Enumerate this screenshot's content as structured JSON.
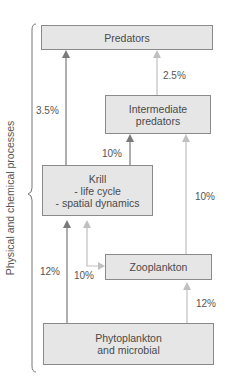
{
  "side_label": "Physical and chemical processes",
  "nodes": {
    "predators": {
      "label": "Predators"
    },
    "intermediate": {
      "line1": "Intermediate",
      "line2": "predators"
    },
    "krill": {
      "line1": "Krill",
      "line2": "- life cycle",
      "line3": "- spatial dynamics"
    },
    "zooplankton": {
      "label": "Zooplankton"
    },
    "phytoplankton": {
      "line1": "Phytoplankton",
      "line2": "and microbial"
    }
  },
  "edges": {
    "krill_to_predators": "3.5%",
    "intermediate_to_predators": "2.5%",
    "krill_to_intermediate": "10%",
    "zooplankton_to_intermediate": "10%",
    "phyto_to_krill": "12%",
    "zooplankton_krill": "10%",
    "phyto_to_zooplankton": "12%"
  },
  "colors": {
    "box_fill": "#e6e6e6",
    "box_border": "#8a8a8a",
    "dark_arrow": "#7a7a7a",
    "light_arrow": "#c0c0c0"
  }
}
